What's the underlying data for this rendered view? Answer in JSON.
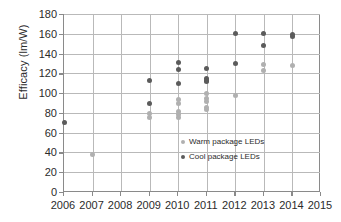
{
  "chart_data": {
    "type": "scatter",
    "title": "",
    "xlabel": "",
    "ylabel": "Efficacy (lm/W)",
    "xlim": [
      2006,
      2015
    ],
    "ylim": [
      0,
      180
    ],
    "ytick_step": 20,
    "grid": true,
    "legend_position": "inside-center",
    "xticks": [
      "2006",
      "2007",
      "2008",
      "2009",
      "2010",
      "2011",
      "2012",
      "2013",
      "2014",
      "2015"
    ],
    "yticks": [
      "0",
      "20",
      "40",
      "60",
      "80",
      "100",
      "120",
      "140",
      "160",
      "180"
    ],
    "series": [
      {
        "name": "Warm package LEDs",
        "color": "#b0b0b0",
        "marker": "circle",
        "points": [
          {
            "x": 2007,
            "y": 38
          },
          {
            "x": 2009,
            "y": 79
          },
          {
            "x": 2009,
            "y": 75
          },
          {
            "x": 2010,
            "y": 94
          },
          {
            "x": 2010,
            "y": 89
          },
          {
            "x": 2010,
            "y": 81
          },
          {
            "x": 2010,
            "y": 78
          },
          {
            "x": 2010,
            "y": 75
          },
          {
            "x": 2011,
            "y": 100
          },
          {
            "x": 2011,
            "y": 95
          },
          {
            "x": 2011,
            "y": 92
          },
          {
            "x": 2011,
            "y": 85
          },
          {
            "x": 2011,
            "y": 83
          },
          {
            "x": 2012,
            "y": 98
          },
          {
            "x": 2013,
            "y": 129
          },
          {
            "x": 2013,
            "y": 123
          },
          {
            "x": 2014,
            "y": 128
          }
        ]
      },
      {
        "name": "Cool package LEDs",
        "color": "#5b5b5b",
        "marker": "circle",
        "points": [
          {
            "x": 2006,
            "y": 70
          },
          {
            "x": 2009,
            "y": 113
          },
          {
            "x": 2009,
            "y": 90
          },
          {
            "x": 2010,
            "y": 131
          },
          {
            "x": 2010,
            "y": 124
          },
          {
            "x": 2010,
            "y": 110
          },
          {
            "x": 2011,
            "y": 125
          },
          {
            "x": 2011,
            "y": 115
          },
          {
            "x": 2011,
            "y": 113
          },
          {
            "x": 2011,
            "y": 112
          },
          {
            "x": 2012,
            "y": 160
          },
          {
            "x": 2012,
            "y": 130
          },
          {
            "x": 2013,
            "y": 160
          },
          {
            "x": 2013,
            "y": 148
          },
          {
            "x": 2014,
            "y": 159
          },
          {
            "x": 2014,
            "y": 157
          }
        ]
      }
    ]
  },
  "legend": {
    "entries": [
      {
        "label": "Warm package LEDs",
        "series": "warm"
      },
      {
        "label": "Cool package LEDs",
        "series": "cool"
      }
    ]
  },
  "axes": {
    "y_title": "Efficacy (lm/W)"
  }
}
